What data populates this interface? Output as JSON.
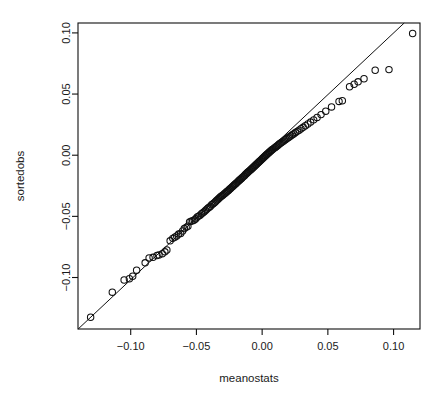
{
  "chart_data": {
    "type": "scatter",
    "title": "",
    "xlabel": "meanostats",
    "ylabel": "sortedobs",
    "xlim": [
      -0.1401,
      0.1201
    ],
    "ylim": [
      -0.1421,
      0.1081
    ],
    "xticks": [
      -0.1,
      -0.05,
      0.0,
      0.05,
      0.1
    ],
    "xticklabels": [
      "-0.10",
      "-0.05",
      "0.00",
      "0.05",
      "0.10"
    ],
    "yticks": [
      -0.1,
      -0.05,
      0.0,
      0.05,
      0.1
    ],
    "yticklabels": [
      "-0.10",
      "-0.05",
      "0.00",
      "0.05",
      "0.10"
    ],
    "grid": false,
    "legend": null,
    "marker": "open-circle",
    "marker_size": 3.2,
    "point_color": "#101010",
    "line_color": "#101010",
    "reference_line": {
      "type": "line",
      "x": [
        -0.1305,
        0.0995
      ],
      "y": [
        -0.1325,
        0.0995
      ],
      "slope": 1.0087,
      "intercept": -0.0009
    },
    "x": [
      -0.1305,
      -0.114,
      -0.105,
      -0.101,
      -0.0985,
      -0.0955,
      -0.089,
      -0.086,
      -0.083,
      -0.08,
      -0.0785,
      -0.076,
      -0.074,
      -0.0725,
      -0.07,
      -0.068,
      -0.0665,
      -0.065,
      -0.0635,
      -0.062,
      -0.0605,
      -0.0592,
      -0.0578,
      -0.0565,
      -0.0552,
      -0.054,
      -0.0528,
      -0.0516,
      -0.0505,
      -0.0494,
      -0.0483,
      -0.0472,
      -0.0461,
      -0.0451,
      -0.0441,
      -0.0431,
      -0.0421,
      -0.0411,
      -0.0402,
      -0.0393,
      -0.0384,
      -0.0375,
      -0.0366,
      -0.0357,
      -0.0349,
      -0.034,
      -0.0332,
      -0.0324,
      -0.0316,
      -0.0308,
      -0.03,
      -0.0292,
      -0.0285,
      -0.0277,
      -0.027,
      -0.0262,
      -0.0255,
      -0.0248,
      -0.0241,
      -0.0234,
      -0.0227,
      -0.022,
      -0.0213,
      -0.0206,
      -0.0199,
      -0.0193,
      -0.0186,
      -0.018,
      -0.0173,
      -0.0167,
      -0.016,
      -0.0154,
      -0.0148,
      -0.0141,
      -0.0135,
      -0.0129,
      -0.0123,
      -0.0117,
      -0.0111,
      -0.0105,
      -0.0099,
      -0.0093,
      -0.0087,
      -0.0081,
      -0.0075,
      -0.0069,
      -0.0063,
      -0.0057,
      -0.0051,
      -0.0045,
      -0.0039,
      -0.0033,
      -0.0027,
      -0.0021,
      -0.0015,
      -0.0009,
      -0.0003,
      0.0003,
      0.0009,
      0.0015,
      0.0021,
      0.0027,
      0.0033,
      0.0039,
      0.0046,
      0.0052,
      0.0058,
      0.0065,
      0.0071,
      0.0078,
      0.0085,
      0.0092,
      0.0099,
      0.0106,
      0.0113,
      0.0121,
      0.0128,
      0.0136,
      0.0144,
      0.0152,
      0.0161,
      0.017,
      0.0179,
      0.0188,
      0.0198,
      0.0208,
      0.0219,
      0.023,
      0.0242,
      0.0254,
      0.0267,
      0.0281,
      0.0296,
      0.0312,
      0.0329,
      0.0348,
      0.0369,
      0.0392,
      0.0418,
      0.0448,
      0.0484,
      0.0528,
      0.0585,
      0.061,
      0.0665,
      0.07,
      0.073,
      0.0775,
      0.086,
      0.0965,
      0.1145
    ],
    "y": [
      -0.1325,
      -0.112,
      -0.102,
      -0.101,
      -0.099,
      -0.094,
      -0.088,
      -0.084,
      -0.0835,
      -0.082,
      -0.0815,
      -0.0805,
      -0.079,
      -0.0775,
      -0.07,
      -0.068,
      -0.067,
      -0.066,
      -0.0645,
      -0.064,
      -0.062,
      -0.06,
      -0.059,
      -0.058,
      -0.0545,
      -0.054,
      -0.0535,
      -0.053,
      -0.052,
      -0.0505,
      -0.0498,
      -0.049,
      -0.0478,
      -0.047,
      -0.0462,
      -0.0452,
      -0.0442,
      -0.0432,
      -0.0425,
      -0.0418,
      -0.0405,
      -0.0398,
      -0.039,
      -0.0382,
      -0.0372,
      -0.0364,
      -0.0356,
      -0.0348,
      -0.034,
      -0.0334,
      -0.0328,
      -0.032,
      -0.0313,
      -0.0306,
      -0.0298,
      -0.0292,
      -0.0286,
      -0.0279,
      -0.0272,
      -0.0265,
      -0.0258,
      -0.0251,
      -0.0244,
      -0.0238,
      -0.0231,
      -0.0224,
      -0.0218,
      -0.0211,
      -0.0205,
      -0.0198,
      -0.0192,
      -0.0186,
      -0.0179,
      -0.0173,
      -0.0167,
      -0.016,
      -0.0154,
      -0.0148,
      -0.0142,
      -0.0136,
      -0.013,
      -0.0124,
      -0.0118,
      -0.0112,
      -0.0106,
      -0.01,
      -0.0094,
      -0.0088,
      -0.0082,
      -0.0076,
      -0.007,
      -0.0064,
      -0.0058,
      -0.0052,
      -0.0046,
      -0.004,
      -0.0033,
      -0.0027,
      -0.0021,
      -0.0015,
      -0.0008,
      -0.0002,
      0.0004,
      0.001,
      0.0016,
      0.0022,
      0.0028,
      0.0034,
      0.004,
      0.0046,
      0.0052,
      0.0058,
      0.0064,
      0.007,
      0.0076,
      0.0082,
      0.0089,
      0.0095,
      0.0102,
      0.0108,
      0.0115,
      0.0122,
      0.0129,
      0.0136,
      0.0143,
      0.0151,
      0.0159,
      0.0167,
      0.0176,
      0.0185,
      0.0195,
      0.0205,
      0.0216,
      0.0228,
      0.0241,
      0.0255,
      0.0271,
      0.0289,
      0.0309,
      0.0332,
      0.036,
      0.0395,
      0.044,
      0.0445,
      0.056,
      0.058,
      0.06,
      0.0625,
      0.0695,
      0.07,
      0.0995
    ]
  },
  "labels": {
    "x_axis": "meanostats",
    "y_axis": "sortedobs"
  }
}
